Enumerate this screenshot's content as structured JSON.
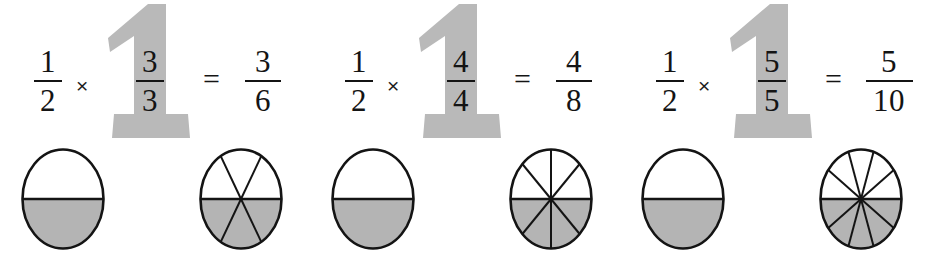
{
  "page": {
    "background_color": "#ffffff",
    "ink_color": "#141414",
    "gray_fill_color": "#b4b4b4",
    "big_one_color": "#b9b9b9"
  },
  "symbols": {
    "times": "×",
    "equals": "=",
    "big_one_glyph": "1"
  },
  "equations": [
    {
      "id": "eq-1",
      "left": {
        "numerator": "1",
        "denominator": "2"
      },
      "operator": "×",
      "unit": {
        "numerator": "3",
        "denominator": "3",
        "glyph": "1"
      },
      "relation": "=",
      "result": {
        "numerator": "3",
        "denominator": "6"
      }
    },
    {
      "id": "eq-2",
      "left": {
        "numerator": "1",
        "denominator": "2"
      },
      "operator": "×",
      "unit": {
        "numerator": "4",
        "denominator": "4",
        "glyph": "1"
      },
      "relation": "=",
      "result": {
        "numerator": "4",
        "denominator": "8"
      }
    },
    {
      "id": "eq-3",
      "left": {
        "numerator": "1",
        "denominator": "2"
      },
      "operator": "×",
      "unit": {
        "numerator": "5",
        "denominator": "5",
        "glyph": "1"
      },
      "relation": "=",
      "result": {
        "numerator": "5",
        "denominator": "10"
      }
    }
  ],
  "chart_data": {
    "type": "pie",
    "note": "Each circle is divided into equal sectors; the lower half is shaded gray.",
    "shaded_color": "#b4b4b4",
    "unshaded_color": "#ffffff",
    "outline_color": "#141414",
    "circles": [
      {
        "label": "1/2",
        "slices": 2,
        "shaded": 1,
        "fraction_value": 0.5,
        "shaded_region": "bottom half"
      },
      {
        "label": "3/6",
        "slices": 6,
        "shaded": 3,
        "fraction_value": 0.5,
        "shaded_region": "bottom half"
      },
      {
        "label": "1/2",
        "slices": 2,
        "shaded": 1,
        "fraction_value": 0.5,
        "shaded_region": "bottom half"
      },
      {
        "label": "4/8",
        "slices": 8,
        "shaded": 4,
        "fraction_value": 0.5,
        "shaded_region": "bottom half"
      },
      {
        "label": "1/2",
        "slices": 2,
        "shaded": 1,
        "fraction_value": 0.5,
        "shaded_region": "bottom half"
      },
      {
        "label": "5/10",
        "slices": 10,
        "shaded": 5,
        "fraction_value": 0.5,
        "shaded_region": "bottom half"
      }
    ]
  }
}
